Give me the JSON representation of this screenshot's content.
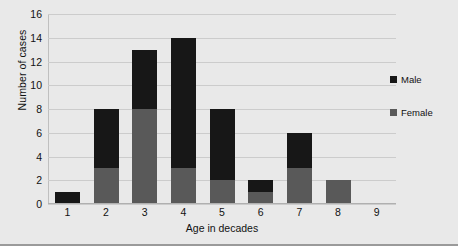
{
  "chart_data": {
    "type": "bar",
    "subtype": "stacked",
    "title": "",
    "xlabel": "Age in decades",
    "ylabel": "Number of cases",
    "categories": [
      "1",
      "2",
      "3",
      "4",
      "5",
      "6",
      "7",
      "8",
      "9"
    ],
    "series": [
      {
        "name": "Female",
        "color": "#595959",
        "values": [
          0,
          3,
          8,
          3,
          2,
          1,
          3,
          2,
          0
        ]
      },
      {
        "name": "Male",
        "color": "#171717",
        "values": [
          1,
          5,
          5,
          11,
          6,
          1,
          3,
          0,
          0
        ]
      }
    ],
    "totals": [
      1,
      8,
      13,
      14,
      8,
      2,
      6,
      2,
      0
    ],
    "ylim": [
      0,
      16
    ],
    "yticks": [
      0,
      2,
      4,
      6,
      8,
      10,
      12,
      14,
      16
    ],
    "ytick_labels": [
      "0",
      "2",
      "4",
      "6",
      "8",
      "10",
      "12",
      "14",
      "16"
    ],
    "grid": true,
    "grid_axis": "y",
    "legend_position": "right",
    "legend": [
      "Male",
      "Female"
    ]
  },
  "colors": {
    "background": "#e9e9e9",
    "plot_background": "#e9e9e9",
    "gridline": "#cccccc",
    "axis": "#b0b0b0",
    "male": "#171717",
    "female": "#595959",
    "text": "#111111",
    "frame_border": "#9a9a9a"
  },
  "legend": {
    "items": [
      {
        "label": "Male",
        "color": "#171717"
      },
      {
        "label": "Female",
        "color": "#595959"
      }
    ]
  },
  "axes": {
    "y_title": "Number of cases",
    "x_title": "Age in decades"
  }
}
